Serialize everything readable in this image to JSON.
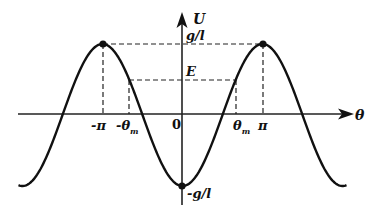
{
  "diagram": {
    "axes": {
      "x_label": "θ",
      "y_label": "U",
      "origin_label": "0"
    },
    "y_ticks": {
      "top": "g/l",
      "energy": "E",
      "bottom": "-g/l"
    },
    "x_ticks": {
      "neg_pi": "-π",
      "neg_theta_m": "-θ",
      "neg_theta_m_sub": "m",
      "theta_m": "θ",
      "theta_m_sub": "m",
      "pi": "π"
    },
    "colors": {
      "curve": "#111111",
      "axis": "#222222",
      "dashed": "#222222",
      "background": "#ffffff"
    }
  },
  "chart_data": {
    "type": "line",
    "function": "U = -(g/l) cos(θ)",
    "x_range_in_pi": [
      -2.05,
      2.05
    ],
    "y_range": [
      -1,
      1
    ],
    "marked_points": [
      {
        "label": "max at -π",
        "theta": "-π",
        "U": "g/l"
      },
      {
        "label": "max at π",
        "theta": "π",
        "U": "g/l"
      },
      {
        "label": "min at 0",
        "theta": "0",
        "U": "-g/l"
      }
    ],
    "energy_level": {
      "label": "E",
      "U_over_gl": 0.49,
      "intersections": [
        "-θm",
        "θm"
      ]
    }
  }
}
